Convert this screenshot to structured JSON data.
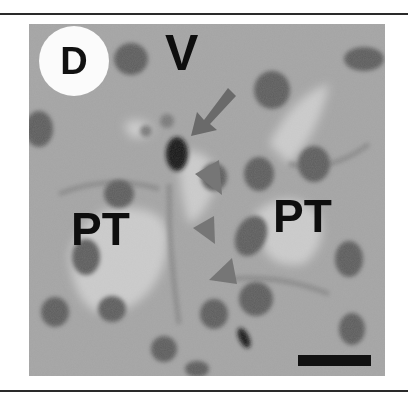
{
  "figure": {
    "panel_label": "D",
    "labels": {
      "vessel": "V",
      "tubule_left": "PT",
      "tubule_right": "PT"
    },
    "annotations": {
      "arrow_count": 1,
      "arrowhead_count": 3,
      "arrow_color": "#6a6a6a",
      "scale_bar": true
    },
    "colors": {
      "background": "#a3a3a3",
      "nucleus": "#5a5a5a",
      "lumen": "#cfcfcf",
      "text": "#0e0e0e"
    }
  }
}
